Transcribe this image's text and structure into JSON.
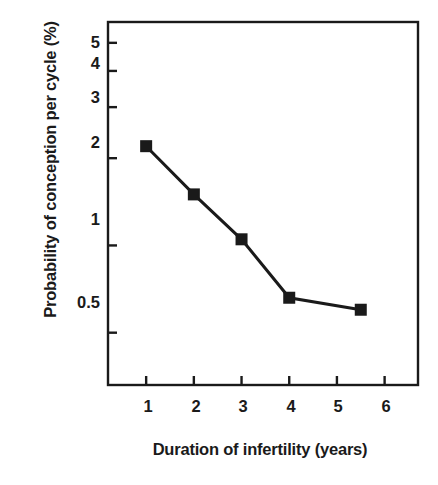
{
  "chart_data": {
    "type": "line",
    "title": "",
    "subtitle": "",
    "xlabel": "Duration of infertility (years)",
    "ylabel": "Probability of conception per cycle (%)",
    "x": [
      1,
      2,
      3,
      4,
      5.5
    ],
    "values": [
      2.2,
      1.5,
      1.05,
      0.66,
      0.6
    ],
    "series": [
      {
        "name": "Probability of conception per cycle",
        "x": [
          1,
          2,
          3,
          4,
          5.5
        ],
        "values": [
          2.2,
          1.5,
          1.05,
          0.66,
          0.6
        ],
        "marker": "filled-square",
        "color": "#1a1a1a"
      }
    ],
    "xlim": [
      0.2,
      6.7
    ],
    "ylim": [
      0.33,
      5.9
    ],
    "yscale": "log",
    "xscale": "linear",
    "xticks": [
      1,
      2,
      3,
      4,
      5,
      6
    ],
    "xtick_labels": [
      "1",
      "2",
      "3",
      "4",
      "5",
      "6"
    ],
    "yticks": [
      0.5,
      1,
      2,
      3,
      4,
      5
    ],
    "ytick_labels": [
      "0.5",
      "1",
      "2",
      "3",
      "4",
      "5"
    ],
    "grid": false,
    "legend": null,
    "legend_position": "none",
    "annotations": [],
    "frame": "box",
    "line_color": "#1a1a1a",
    "marker_color": "#1a1a1a",
    "background_color": "#ffffff"
  },
  "axes": {
    "y_tick_labels": [
      {
        "label": "5"
      },
      {
        "label": "4"
      },
      {
        "label": "3"
      },
      {
        "label": "2"
      },
      {
        "label": "1"
      },
      {
        "label": "0.5"
      }
    ],
    "x_tick_labels": [
      {
        "label": "1"
      },
      {
        "label": "2"
      },
      {
        "label": "3"
      },
      {
        "label": "4"
      },
      {
        "label": "5"
      },
      {
        "label": "6"
      }
    ],
    "x_axis_title": "Duration of infertility (years)",
    "y_axis_title": "Probability of conception per cycle (%)"
  }
}
